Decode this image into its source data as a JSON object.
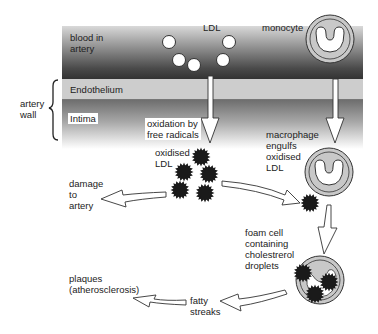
{
  "diagram": {
    "layers": {
      "blood": "blood in\nartery",
      "endothelium": "Endothelium",
      "intima": "Intima",
      "wall": "artery\nwall"
    },
    "labels": {
      "ldl": "LDL",
      "monocyte": "monocyte",
      "oxidation": "oxidation by\nfree radicals",
      "macrophage": "macrophage\nengulfs\noxidised\nLDL",
      "oxidised_ldl": "oxidised\nLDL",
      "damage": "damage\nto\nartery",
      "foam_cell": "foam cell\ncontaining\ncholestrerol\ndroplets",
      "plaques": "plaques\n(atherosclerosis)",
      "fatty_streaks": "fatty\nstreaks"
    },
    "colors": {
      "cell_fill": "#c8c8c8",
      "ldl_oxidised": "#1a1a1a",
      "arrow_fill": "#ffffff",
      "outline": "#333333"
    }
  }
}
